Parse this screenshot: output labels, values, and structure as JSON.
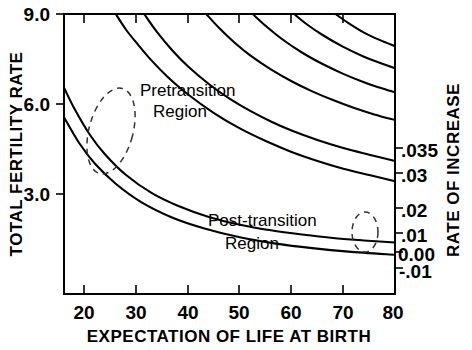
{
  "chart_data": {
    "type": "line",
    "title": "",
    "xlabel": "EXPECTATION OF LIFE AT BIRTH",
    "ylabel": "TOTAL FERTILITY RATE",
    "y2label": "RATE OF INCREASE",
    "xlim": [
      16,
      80
    ],
    "ylim": [
      1.0,
      9.0
    ],
    "grid": false,
    "legend": "right-edge-curve-labels",
    "xticks": [
      "20",
      "30",
      "40",
      "50",
      "60",
      "70",
      "80"
    ],
    "xtick_values": [
      20,
      30,
      40,
      50,
      60,
      70,
      80
    ],
    "yticks": [
      "9.0",
      "6.0",
      "3.0"
    ],
    "ytick_values": [
      9.0,
      6.0,
      3.0
    ],
    "y2ticks": [
      ".035",
      ".03",
      ".02",
      ".01",
      "0.00",
      "-.01"
    ],
    "y2tick_values": [
      0.035,
      0.03,
      0.02,
      0.01,
      0.0,
      -0.01
    ],
    "series": [
      {
        "name": ".035",
        "label": ".035",
        "rate": 0.035,
        "x": [
          26.0,
          28.0,
          30.0,
          33.0,
          36.0,
          40.0,
          45.0,
          50.0,
          55.0,
          60.0,
          65.0,
          70.0,
          75.0,
          80.0
        ],
        "y": [
          9.0,
          8.55,
          8.18,
          7.66,
          7.21,
          6.7,
          6.17,
          5.73,
          5.37,
          5.06,
          4.8,
          4.58,
          4.4,
          4.22
        ]
      },
      {
        "name": ".03",
        "label": ".03",
        "rate": 0.03,
        "x": [
          31.5,
          34.0,
          37.0,
          40.0,
          44.0,
          48.0,
          52.0,
          56.0,
          60.0,
          65.0,
          70.0,
          75.0,
          80.0
        ],
        "y": [
          9.0,
          8.48,
          7.95,
          7.5,
          7.0,
          6.58,
          6.23,
          5.93,
          5.67,
          5.4,
          5.17,
          4.98,
          4.8
        ]
      },
      {
        "name": ".02",
        "label": ".02",
        "rate": 0.02,
        "x": [
          43.5,
          46.0,
          49.0,
          52.0,
          56.0,
          60.0,
          64.0,
          68.0,
          72.0,
          76.0,
          80.0
        ],
        "y": [
          9.0,
          8.6,
          8.18,
          7.82,
          7.42,
          7.08,
          6.79,
          6.54,
          6.32,
          6.13,
          5.97
        ]
      },
      {
        "name": ".01",
        "label": ".01",
        "rate": 0.01,
        "x": [
          52.5,
          55.0,
          58.0,
          62.0,
          66.0,
          70.0,
          74.0,
          77.0,
          80.0
        ],
        "y": [
          9.0,
          8.66,
          8.3,
          7.9,
          7.57,
          7.29,
          7.05,
          6.9,
          6.76
        ]
      },
      {
        "name": "0.00",
        "label": "0.00",
        "rate": 0.0,
        "x": [
          60.5,
          63.0,
          66.0,
          70.0,
          74.0,
          77.0,
          80.0
        ],
        "y": [
          9.0,
          8.7,
          8.4,
          8.06,
          7.78,
          7.61,
          7.45
        ]
      },
      {
        "name": "-.01",
        "label": "-.01",
        "rate": -0.01,
        "x": [
          68.5,
          71.0,
          74.0,
          77.0,
          80.0
        ],
        "y": [
          9.0,
          8.74,
          8.47,
          8.26,
          8.08
        ]
      },
      {
        "name": "curve-upper-left-a",
        "label": "",
        "rate": null,
        "x": [
          16.0,
          18.0,
          21.0,
          24.0,
          28.0,
          33.0,
          38.0,
          44.0,
          50.0,
          56.0,
          62.0,
          68.0,
          74.0,
          80.0
        ],
        "y": [
          6.9,
          6.3,
          5.55,
          4.98,
          4.4,
          3.88,
          3.52,
          3.2,
          2.98,
          2.82,
          2.7,
          2.6,
          2.53,
          2.47
        ]
      },
      {
        "name": "curve-upper-left-b",
        "label": "",
        "rate": null,
        "x": [
          16.0,
          19.0,
          22.0,
          26.0,
          31.0,
          37.0,
          43.0,
          50.0,
          57.0,
          64.0,
          71.0,
          80.0
        ],
        "y": [
          6.05,
          5.3,
          4.72,
          4.15,
          3.62,
          3.18,
          2.88,
          2.62,
          2.44,
          2.31,
          2.21,
          2.12
        ]
      }
    ],
    "annotations": [
      {
        "name": "pretransition",
        "lines": [
          "Pretransition",
          "Region"
        ],
        "text": "Pretransition Region",
        "ellipse": {
          "cx": 111,
          "cy": 131,
          "rx": 22,
          "ry": 44,
          "rotation": 15,
          "dashed": true
        }
      },
      {
        "name": "post-transition",
        "lines": [
          "Post-transition",
          "Region"
        ],
        "text": "Post-transition Region",
        "ellipse": {
          "cx": 365,
          "cy": 232,
          "rx": 13,
          "ry": 20,
          "rotation": 0,
          "dashed": true
        }
      }
    ],
    "colors": {
      "line": "#000000",
      "axis": "#000000",
      "background": "#ffffff",
      "dashed_annotation": "#333333"
    }
  }
}
